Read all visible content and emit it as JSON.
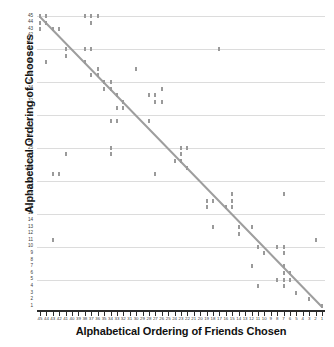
{
  "chart_data": {
    "type": "scatter",
    "title": "",
    "xlabel": "Alphabetical Ordering of Friends Chosen",
    "ylabel": "Alphabetical Ordering of Choosers",
    "xlim": [
      45,
      1
    ],
    "ylim": [
      1,
      45
    ],
    "x_tick_labels": [
      45,
      44,
      43,
      42,
      41,
      40,
      39,
      38,
      37,
      36,
      35,
      34,
      33,
      32,
      31,
      30,
      29,
      28,
      27,
      26,
      25,
      24,
      23,
      22,
      21,
      20,
      19,
      18,
      17,
      16,
      15,
      14,
      13,
      12,
      11,
      10,
      9,
      8,
      7,
      6,
      5,
      4,
      3,
      2,
      1
    ],
    "y_tick_labels": [
      45,
      44,
      43,
      42,
      41,
      40,
      39,
      38,
      37,
      36,
      35,
      34,
      33,
      32,
      31,
      30,
      29,
      28,
      27,
      26,
      25,
      24,
      23,
      22,
      21,
      20,
      19,
      18,
      17,
      16,
      15,
      14,
      13,
      12,
      11,
      10,
      9,
      8,
      7,
      6,
      5,
      4,
      3,
      2,
      1
    ],
    "grid": "horizontal",
    "gridline_values": [
      45,
      40,
      35,
      30,
      25,
      20,
      15,
      10,
      5
    ],
    "legend": "none",
    "marker_color": "#9a9a9a",
    "trendline_color": "#9e9e9e",
    "gridline_color": "#dcdcdc",
    "axis_color": "#2b2b2b",
    "trendline": {
      "x_start": 45,
      "y_start": 45,
      "x_end": 1,
      "y_end": 1
    },
    "points": [
      [
        45,
        45
      ],
      [
        44,
        45
      ],
      [
        38,
        45
      ],
      [
        37,
        45
      ],
      [
        36,
        45
      ],
      [
        44,
        44
      ],
      [
        37,
        44
      ],
      [
        45,
        44
      ],
      [
        45,
        43
      ],
      [
        43,
        43
      ],
      [
        42,
        43
      ],
      [
        41,
        40
      ],
      [
        38,
        40
      ],
      [
        37,
        40
      ],
      [
        17,
        40
      ],
      [
        41,
        39
      ],
      [
        44,
        38
      ],
      [
        38,
        38
      ],
      [
        36,
        37
      ],
      [
        30,
        37
      ],
      [
        37,
        36
      ],
      [
        36,
        36
      ],
      [
        35,
        35
      ],
      [
        34,
        35
      ],
      [
        35,
        34
      ],
      [
        34,
        34
      ],
      [
        26,
        34
      ],
      [
        33,
        33
      ],
      [
        28,
        33
      ],
      [
        27,
        33
      ],
      [
        32,
        32
      ],
      [
        27,
        32
      ],
      [
        26,
        32
      ],
      [
        33,
        31
      ],
      [
        32,
        31
      ],
      [
        34,
        29
      ],
      [
        33,
        29
      ],
      [
        28,
        29
      ],
      [
        34,
        25
      ],
      [
        23,
        25
      ],
      [
        22,
        25
      ],
      [
        34,
        24
      ],
      [
        41,
        24
      ],
      [
        23,
        24
      ],
      [
        24,
        23
      ],
      [
        23,
        23
      ],
      [
        22,
        22
      ],
      [
        43,
        21
      ],
      [
        42,
        21
      ],
      [
        27,
        21
      ],
      [
        15,
        18
      ],
      [
        7,
        18
      ],
      [
        19,
        17
      ],
      [
        18,
        17
      ],
      [
        15,
        17
      ],
      [
        19,
        16
      ],
      [
        16,
        16
      ],
      [
        15,
        16
      ],
      [
        18,
        13
      ],
      [
        14,
        13
      ],
      [
        12,
        13
      ],
      [
        14,
        12
      ],
      [
        43,
        11
      ],
      [
        2,
        11
      ],
      [
        11,
        10
      ],
      [
        8,
        10
      ],
      [
        7,
        10
      ],
      [
        10,
        9
      ],
      [
        7,
        9
      ],
      [
        12,
        7
      ],
      [
        7,
        7
      ],
      [
        7,
        6
      ],
      [
        6,
        6
      ],
      [
        8,
        5
      ],
      [
        7,
        5
      ],
      [
        6,
        5
      ],
      [
        11,
        4
      ],
      [
        7,
        4
      ],
      [
        5,
        3
      ],
      [
        3,
        2
      ],
      [
        1,
        1
      ]
    ]
  }
}
